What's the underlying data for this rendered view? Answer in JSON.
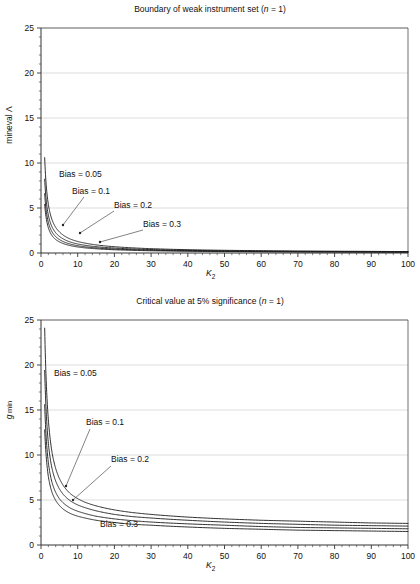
{
  "figure": {
    "background": "#ffffff",
    "axis_color": "#4d4d4d",
    "grid_color": "#c8c8c8",
    "curve_color": "#1a1a1a",
    "leader_color": "#4d4d4d"
  },
  "panels": [
    {
      "id": "top",
      "title_prefix": "Boundary of weak instrument set (",
      "title_italic": "n",
      "title_suffix": " = 1)",
      "ylabel_text": "mineval Λ",
      "xlabel_italic": "K",
      "xlabel_sub": "2",
      "annotations": [
        {
          "label": "Bias = 0.05",
          "x": 59,
          "y": 177,
          "leader": null
        },
        {
          "label": "Bias = 0.1",
          "x": 72,
          "y": 194,
          "leader": {
            "x1": 84,
            "y1": 197,
            "x2": 63,
            "y2": 225
          }
        },
        {
          "label": "Bias = 0.2",
          "x": 114,
          "y": 208,
          "leader": {
            "x1": 114,
            "y1": 211,
            "x2": 80,
            "y2": 233
          }
        },
        {
          "label": "Bias = 0.3",
          "x": 143,
          "y": 227,
          "leader": {
            "x1": 143,
            "y1": 230,
            "x2": 100,
            "y2": 242
          }
        }
      ]
    },
    {
      "id": "bottom",
      "title_prefix": "Critical value at 5% significance (",
      "title_italic": "n",
      "title_suffix": " = 1)",
      "ylabel_text": "g min",
      "xlabel_italic": "K",
      "xlabel_sub": "2",
      "annotations": [
        {
          "label": "Bias = 0.05",
          "x": 54,
          "y": 84,
          "leader": null
        },
        {
          "label": "Bias = 0.1",
          "x": 86,
          "y": 133,
          "leader": {
            "x1": 90,
            "y1": 137,
            "x2": 66,
            "y2": 194
          }
        },
        {
          "label": "Bias = 0.2",
          "x": 111,
          "y": 170,
          "leader": {
            "x1": 111,
            "y1": 174,
            "x2": 73,
            "y2": 208
          }
        },
        {
          "label": "Bias = 0.3",
          "x": 100,
          "y": 235,
          "leader": null
        }
      ]
    }
  ],
  "chart_data": [
    {
      "type": "line",
      "panel": "top",
      "title": "Boundary of weak instrument set (n = 1)",
      "xlabel": "K2",
      "ylabel": "mineval Λ",
      "xlim": [
        0,
        100
      ],
      "ylim": [
        0,
        25
      ],
      "xticks": [
        0,
        10,
        20,
        30,
        40,
        50,
        60,
        70,
        80,
        90,
        100
      ],
      "yticks": [
        0,
        5,
        10,
        15,
        20,
        25
      ],
      "xminor_step": 2,
      "yminor_step": 1,
      "grid": "horizontal-major",
      "legend": "inline-annotations",
      "x": [
        1,
        2,
        3,
        4,
        5,
        6,
        8,
        10,
        12,
        15,
        20,
        25,
        30,
        40,
        50,
        60,
        70,
        80,
        90,
        100
      ],
      "series": [
        {
          "name": "Bias = 0.05",
          "values": [
            10.6,
            5.4,
            3.7,
            2.85,
            2.35,
            2.0,
            1.55,
            1.28,
            1.1,
            0.9,
            0.7,
            0.57,
            0.48,
            0.37,
            0.3,
            0.26,
            0.22,
            0.2,
            0.18,
            0.16
          ]
        },
        {
          "name": "Bias = 0.1",
          "values": [
            8.2,
            4.2,
            2.9,
            2.25,
            1.85,
            1.58,
            1.22,
            1.0,
            0.86,
            0.7,
            0.55,
            0.45,
            0.38,
            0.29,
            0.24,
            0.2,
            0.18,
            0.16,
            0.14,
            0.13
          ]
        },
        {
          "name": "Bias = 0.2",
          "values": [
            6.6,
            3.4,
            2.35,
            1.82,
            1.5,
            1.28,
            0.99,
            0.81,
            0.69,
            0.57,
            0.44,
            0.36,
            0.31,
            0.24,
            0.19,
            0.16,
            0.14,
            0.13,
            0.12,
            0.11
          ]
        },
        {
          "name": "Bias = 0.3",
          "values": [
            5.4,
            2.8,
            1.93,
            1.5,
            1.24,
            1.06,
            0.82,
            0.67,
            0.57,
            0.47,
            0.36,
            0.3,
            0.25,
            0.2,
            0.16,
            0.14,
            0.12,
            0.11,
            0.1,
            0.09
          ]
        }
      ]
    },
    {
      "type": "line",
      "panel": "bottom",
      "title": "Critical value at 5% significance (n = 1)",
      "xlabel": "K2",
      "ylabel": "g min",
      "xlim": [
        0,
        100
      ],
      "ylim": [
        0,
        25
      ],
      "xticks": [
        0,
        10,
        20,
        30,
        40,
        50,
        60,
        70,
        80,
        90,
        100
      ],
      "yticks": [
        0,
        5,
        10,
        15,
        20,
        25
      ],
      "xminor_step": 2,
      "yminor_step": 1,
      "grid": "horizontal-major",
      "legend": "inline-annotations",
      "x": [
        1,
        2,
        3,
        4,
        5,
        6,
        8,
        10,
        12,
        15,
        20,
        25,
        30,
        40,
        50,
        60,
        70,
        80,
        90,
        100
      ],
      "series": [
        {
          "name": "Bias = 0.05",
          "values": [
            24.1,
            13.9,
            10.3,
            8.5,
            7.4,
            6.65,
            5.7,
            5.15,
            4.75,
            4.35,
            3.9,
            3.6,
            3.4,
            3.1,
            2.9,
            2.75,
            2.65,
            2.55,
            2.45,
            2.4
          ]
        },
        {
          "name": "Bias = 0.1",
          "values": [
            19.4,
            11.3,
            8.5,
            7.1,
            6.25,
            5.65,
            4.9,
            4.45,
            4.15,
            3.8,
            3.4,
            3.15,
            3.0,
            2.75,
            2.55,
            2.4,
            2.3,
            2.2,
            2.15,
            2.1
          ]
        },
        {
          "name": "Bias = 0.2",
          "values": [
            15.6,
            9.15,
            6.95,
            5.85,
            5.15,
            4.7,
            4.1,
            3.75,
            3.5,
            3.2,
            2.9,
            2.7,
            2.55,
            2.35,
            2.2,
            2.05,
            1.95,
            1.9,
            1.85,
            1.8
          ]
        },
        {
          "name": "Bias = 0.3",
          "values": [
            12.8,
            7.6,
            5.85,
            4.95,
            4.4,
            4.0,
            3.5,
            3.2,
            3.0,
            2.75,
            2.5,
            2.3,
            2.2,
            2.0,
            1.85,
            1.75,
            1.65,
            1.6,
            1.55,
            1.5
          ]
        }
      ]
    }
  ]
}
